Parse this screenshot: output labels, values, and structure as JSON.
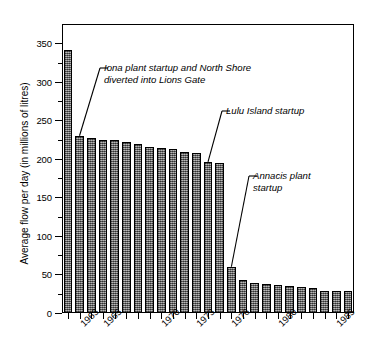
{
  "chart_data": {
    "type": "bar",
    "title": "",
    "xlabel": "",
    "ylabel": "Average flow per day (in millions of litres)",
    "ylim": [
      0,
      375
    ],
    "yticks": [
      0,
      50,
      100,
      150,
      200,
      250,
      300,
      350
    ],
    "ytick_labels": [
      "0",
      "50",
      "100",
      "150",
      "200",
      "250",
      "300",
      "350"
    ],
    "grid": false,
    "legend": "none",
    "categories": [
      "1962",
      "1963",
      "1964",
      "1965",
      "1966",
      "1967",
      "1968",
      "1969",
      "1970",
      "1971",
      "1972",
      "1973",
      "1974",
      "1975",
      "1976",
      "1977",
      "1978",
      "1979",
      "1980",
      "1981",
      "1982",
      "1983",
      "1984",
      "1985",
      "1986"
    ],
    "values": [
      341,
      230,
      227,
      225,
      225,
      222,
      219,
      215,
      214,
      213,
      209,
      207,
      196,
      195,
      60,
      43,
      39,
      38,
      37,
      35,
      34,
      33,
      29,
      29,
      28
    ],
    "xtick_labels": [
      "1963",
      "1965",
      "1970",
      "1973",
      "1976",
      "1980",
      "1985"
    ],
    "xtick_categories": [
      "1963",
      "1965",
      "1970",
      "1973",
      "1976",
      "1980",
      "1985"
    ],
    "bar_color": "#7c7c7c",
    "bar_edge_color": "#000000",
    "axis_color": "#000000",
    "annotations": [
      {
        "text": "Iona plant startup and North Shore\ndiverted into Lions Gate",
        "target_category": "1963",
        "target_value": 230
      },
      {
        "text": "Lulu Island startup",
        "target_category": "1974",
        "target_value": 196
      },
      {
        "text": "Annacis plant\nstartup",
        "target_category": "1976",
        "target_value": 60
      }
    ]
  },
  "annotation_labels": {
    "iona": "Iona plant startup and North Shore\ndiverted into Lions Gate",
    "lulu": "Lulu Island startup",
    "annacis": "Annacis plant\nstartup"
  },
  "axis": {
    "y_title": "Average flow per day (in millions of litres)"
  }
}
